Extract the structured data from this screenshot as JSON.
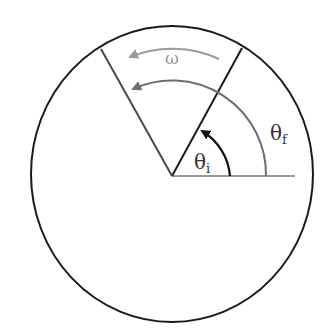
{
  "diagram": {
    "type": "rotation-angle-diagram",
    "labels": {
      "omega": "ω",
      "theta_i_main": "θ",
      "theta_i_sub": "i",
      "theta_f_main": "θ",
      "theta_f_sub": "f"
    },
    "colors": {
      "circle": "#1a1a1a",
      "initial_line": "#1a1a1a",
      "final_line": "#4a4a4a",
      "reference_line": "#9a9a9a",
      "theta_f_arc": "#6e6e6e",
      "theta_i_arc": "#111111",
      "omega_arc": "#9a9a9a",
      "omega_label": "#9a9a9a",
      "text": "#333333"
    }
  }
}
